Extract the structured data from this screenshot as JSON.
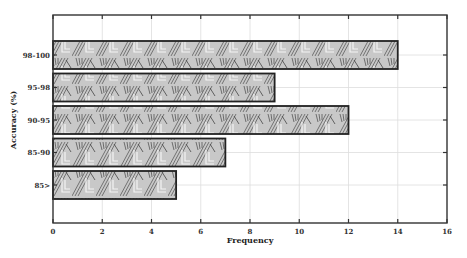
{
  "chart_data": {
    "type": "bar",
    "orientation": "horizontal",
    "title": "",
    "xlabel": "Frequency",
    "ylabel": "Accuracy (%)",
    "categories": [
      "98-100",
      "95-98",
      "90-95",
      "85-90",
      "85>"
    ],
    "values": [
      14,
      9,
      12,
      7,
      5
    ],
    "xlim": [
      0,
      16
    ],
    "xticks": [
      0,
      2,
      4,
      6,
      8,
      10,
      12,
      14,
      16
    ],
    "grid": true,
    "legend": null,
    "bar_style": "hatched pattern, gray fill, black border"
  },
  "colors": {
    "bar_fill": "#b5b5b5",
    "bar_hatch": "#555555",
    "bar_border": "#222222",
    "axis": "#333333",
    "grid": "#dddddd"
  }
}
